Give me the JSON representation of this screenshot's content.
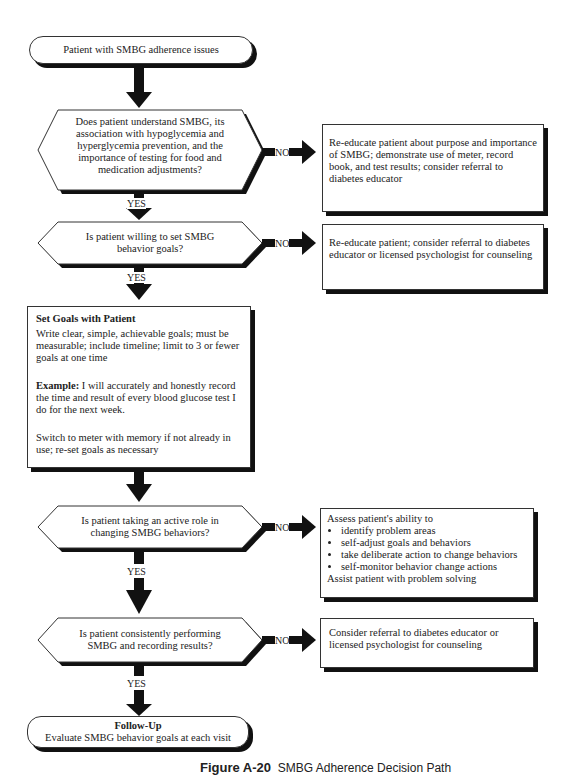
{
  "flowchart": {
    "start": {
      "text": "Patient with SMBG adherence issues"
    },
    "decisions": [
      {
        "question": "Does patient understand SMBG, its association with hypoglycemia and hyperglycemia prevention, and the importance of testing for food and medication adjustments?",
        "no_label": "NO",
        "yes_label": "YES",
        "no_action": "Re-educate patient about purpose and importance of SMBG; demonstrate use of meter, record book, and test results; consider referral to diabetes educator"
      },
      {
        "question": "Is patient willing to set SMBG behavior goals?",
        "no_label": "NO",
        "yes_label": "YES",
        "no_action": "Re-educate patient; consider referral to diabetes educator or licensed psychologist for counseling"
      },
      {
        "question": "Is patient taking an active role in changing SMBG behaviors?",
        "no_label": "NO",
        "yes_label": "YES",
        "no_action_intro": "Assess patient's ability to",
        "no_action_bullets": [
          "identify problem areas",
          "self-adjust goals and behaviors",
          "take deliberate action to change behaviors",
          "self-monitor behavior change actions"
        ],
        "no_action_outro": "Assist patient with problem solving"
      },
      {
        "question": "Is patient consistently performing SMBG and recording results?",
        "no_label": "NO",
        "yes_label": "YES",
        "no_action": "Consider referral to diabetes educator or licensed psychologist for counseling"
      }
    ],
    "set_goals": {
      "title": "Set Goals with Patient",
      "body": "Write clear, simple, achievable goals; must be measurable; include timeline; limit to 3 or fewer goals at one time",
      "example_label": "Example:",
      "example_text": " I will accurately and honestly record the time and result of every blood glucose test I do for the next week.",
      "footer": "Switch to meter with memory if not already in use; re-set goals as necessary"
    },
    "end": {
      "title": "Follow-Up",
      "text": "Evaluate SMBG behavior goals at each visit"
    }
  },
  "caption": {
    "label": "Figure A-20",
    "text": "SMBG Adherence Decision Path"
  }
}
